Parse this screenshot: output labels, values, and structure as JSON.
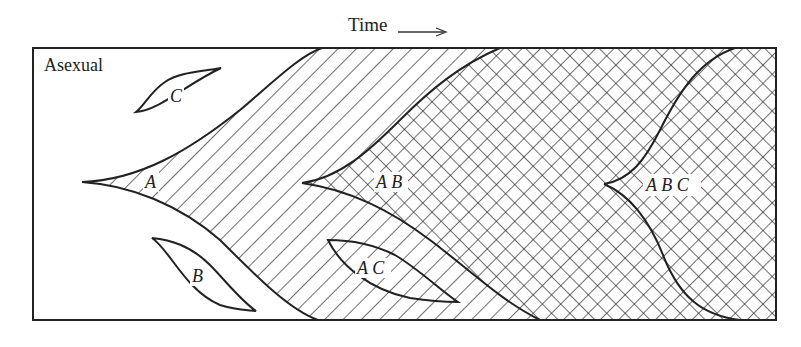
{
  "figure": {
    "axis_label": "Time",
    "axis_arrow": "right-arrow",
    "frame_label": "Asexual",
    "regions": [
      {
        "id": "A",
        "label": "A",
        "fill": "single-diagonal-hatch"
      },
      {
        "id": "B",
        "label": "B",
        "fill": "outline-only"
      },
      {
        "id": "C",
        "label": "C",
        "fill": "outline-only"
      },
      {
        "id": "AB",
        "label": "A B",
        "fill": "cross-hatch"
      },
      {
        "id": "AC",
        "label": "A C",
        "fill": "outline-only"
      },
      {
        "id": "ABC",
        "label": "A B C",
        "fill": "cross-hatch"
      }
    ],
    "colors": {
      "ink": "#222222",
      "background": "#ffffff"
    }
  }
}
